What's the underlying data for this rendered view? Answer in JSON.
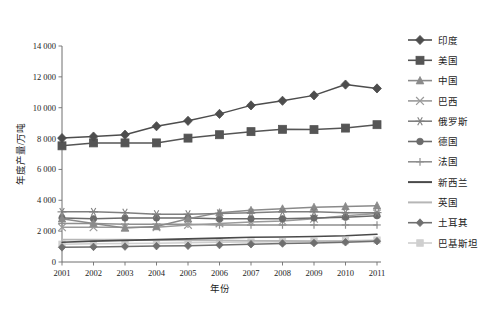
{
  "caption": {
    "text": "图1 世界部分国家天然橡胶年度产量"
  },
  "chart_data": {
    "type": "line",
    "title": "",
    "xlabel": "年份",
    "ylabel": "年度产量/万吨",
    "x": [
      "2001",
      "2002",
      "2003",
      "2004",
      "2005",
      "2006",
      "2007",
      "2008",
      "2009",
      "2010",
      "2011"
    ],
    "xlim": [
      2001,
      2011
    ],
    "ylim": [
      0,
      14000
    ],
    "yticks": [
      "0",
      "2 000",
      "4 000",
      "6 000",
      "8 000",
      "10 000",
      "12 000",
      "14 000"
    ],
    "ytick_values": [
      0,
      2000,
      4000,
      6000,
      8000,
      10000,
      12000,
      14000
    ],
    "grid": false,
    "legend_position": "right",
    "series": [
      {
        "name": "印度",
        "marker": "diamond",
        "color": "#4d4d4d",
        "values": [
          8030,
          8130,
          8250,
          8800,
          9150,
          9600,
          10150,
          10450,
          10800,
          11500,
          11250
        ]
      },
      {
        "name": "美国",
        "marker": "square",
        "color": "#555555",
        "values": [
          7530,
          7720,
          7720,
          7720,
          8030,
          8250,
          8450,
          8600,
          8580,
          8680,
          8900
        ]
      },
      {
        "name": "中国",
        "marker": "triangle",
        "color": "#8a8a8a",
        "values": [
          2800,
          2500,
          2200,
          2300,
          2800,
          3200,
          3350,
          3450,
          3550,
          3600,
          3650
        ]
      },
      {
        "name": "巴西",
        "marker": "cross",
        "color": "#9a9a9a",
        "values": [
          2250,
          2250,
          2250,
          2250,
          2400,
          2500,
          2600,
          2650,
          2800,
          3000,
          3150
        ]
      },
      {
        "name": "俄罗斯",
        "marker": "star",
        "color": "#7f7f7f",
        "values": [
          3250,
          3250,
          3200,
          3100,
          3100,
          3150,
          3200,
          3250,
          3250,
          3200,
          3200
        ]
      },
      {
        "name": "德国",
        "marker": "circle",
        "color": "#6b6b6b",
        "values": [
          2850,
          2800,
          2850,
          2850,
          2850,
          2800,
          2800,
          2800,
          2850,
          2900,
          3000
        ]
      },
      {
        "name": "法国",
        "marker": "plus",
        "color": "#8f8f8f",
        "values": [
          2500,
          2500,
          2450,
          2450,
          2450,
          2400,
          2400,
          2400,
          2400,
          2400,
          2400
        ]
      },
      {
        "name": "新西兰",
        "marker": "none",
        "color": "#4a4a4a",
        "values": [
          1280,
          1350,
          1400,
          1450,
          1500,
          1550,
          1600,
          1620,
          1650,
          1700,
          1800
        ]
      },
      {
        "name": "英国",
        "marker": "none",
        "color": "#b6b6b6",
        "values": [
          1450,
          1450,
          1450,
          1420,
          1400,
          1400,
          1380,
          1370,
          1350,
          1350,
          1380
        ]
      },
      {
        "name": "土耳其",
        "marker": "diamond",
        "color": "#6f6f6f",
        "values": [
          950,
          980,
          1000,
          1030,
          1050,
          1100,
          1150,
          1200,
          1230,
          1280,
          1350
        ]
      },
      {
        "name": "巴基斯坦",
        "marker": "square",
        "color": "#cfcfcf",
        "values": [
          1150,
          1180,
          1200,
          1220,
          1250,
          1280,
          1300,
          1320,
          1350,
          1380,
          1420
        ]
      }
    ]
  }
}
